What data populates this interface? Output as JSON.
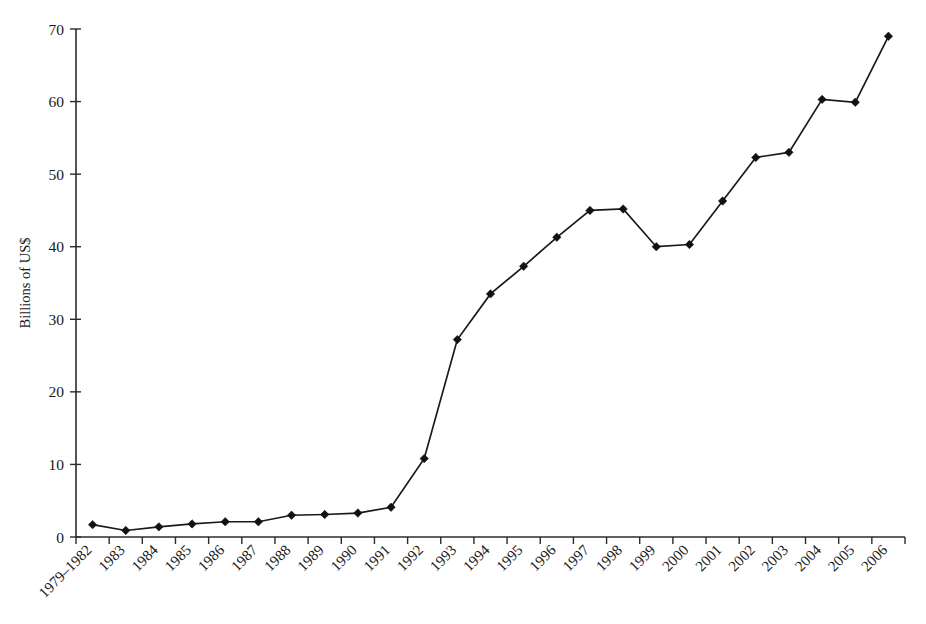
{
  "chart_data": {
    "type": "line",
    "title": "",
    "subtitle": "",
    "xlabel": "",
    "ylabel": "Billions of US$",
    "ylim": [
      0,
      70
    ],
    "yticks": [
      0,
      10,
      20,
      30,
      40,
      50,
      60,
      70
    ],
    "ytick_labels": [
      "0",
      "10",
      "20",
      "30",
      "40",
      "50",
      "60",
      "70"
    ],
    "grid": false,
    "legend": null,
    "legend_position": "none",
    "marker": "diamond",
    "line_color": "#1a1a1a",
    "marker_color": "#111111",
    "categories": [
      "1979–1982",
      "1983",
      "1984",
      "1985",
      "1986",
      "1987",
      "1988",
      "1989",
      "1990",
      "1991",
      "1992",
      "1993",
      "1994",
      "1995",
      "1996",
      "1997",
      "1998",
      "1999",
      "2000",
      "2001",
      "2002",
      "2003",
      "2004",
      "2005",
      "2006"
    ],
    "values": [
      1.7,
      0.9,
      1.4,
      1.8,
      2.1,
      2.1,
      3.0,
      3.1,
      3.3,
      4.1,
      10.8,
      27.2,
      33.5,
      37.3,
      41.3,
      45.0,
      45.2,
      40.0,
      40.3,
      46.3,
      52.3,
      53.0,
      60.3,
      59.9,
      69.0
    ]
  }
}
